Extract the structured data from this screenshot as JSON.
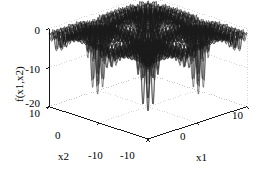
{
  "figure": {
    "type": "matlab-3d-surface-plot",
    "background_color": "#ffffff",
    "mesh_color": "#1a1a1a",
    "axis_color": "#000000",
    "grid_color": "#b4b4b4"
  },
  "axes": {
    "x1": {
      "label": "x1",
      "ticks": [
        "-10",
        "0",
        "10"
      ],
      "tick_values": [
        -10,
        0,
        10
      ],
      "range": [
        -10,
        10
      ]
    },
    "x2": {
      "label": "x2",
      "ticks": [
        "10",
        "0",
        "-10"
      ],
      "tick_values": [
        10,
        0,
        -10
      ],
      "range": [
        -10,
        10
      ]
    },
    "z": {
      "label": "f(x1,x2)",
      "ticks": [
        "0",
        "-10",
        "-20"
      ],
      "tick_values": [
        0,
        -10,
        -20
      ],
      "range": [
        -20,
        0
      ]
    }
  },
  "chart_data": {
    "type": "surface",
    "title": "",
    "xlabel": "x1",
    "ylabel": "x2",
    "zlabel": "f(x1,x2)",
    "xlim": [
      -10,
      10
    ],
    "ylim": [
      -10,
      10
    ],
    "zlim": [
      -20,
      0
    ],
    "xticks": [
      -10,
      0,
      10
    ],
    "yticks": [
      -10,
      0,
      10
    ],
    "zticks": [
      -20,
      -10,
      0
    ],
    "xticklabels": [
      "-10",
      "0",
      "10"
    ],
    "yticklabels": [
      "-10",
      "0",
      "10"
    ],
    "zticklabels": [
      "-20",
      "-10",
      "0"
    ],
    "grid": true,
    "legend": null,
    "colormap": "grayscale-dark",
    "mesh_style": "wireframe-dense",
    "function_name": "shubert",
    "function_expression": "f(x1,x2) = sum_{i=1..5} i*cos((i+1)*x1 + i) * sum_{i=1..5} i*cos((i+1)*x2 + i)",
    "grid_resolution": 101,
    "view": {
      "azimuth": -37.5,
      "elevation": 30
    },
    "z_display_floor": -20,
    "z_plateau": 0,
    "spike_depth_typical": -18,
    "spike_count_per_axis": 6
  }
}
